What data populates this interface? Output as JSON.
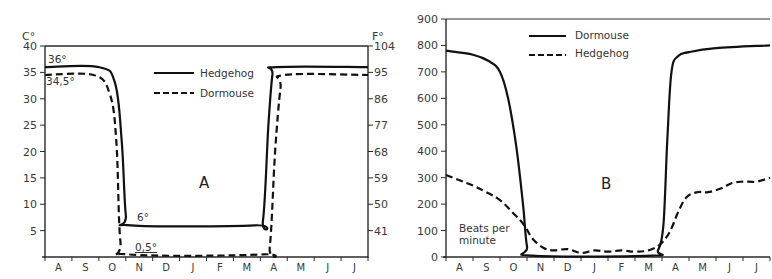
{
  "chart_data": [
    {
      "id": "A",
      "type": "line",
      "panel_label": "A",
      "title": "",
      "xlabel": "",
      "ylabel": "C°",
      "ylabel_right": "F°",
      "categories": [
        "A",
        "S",
        "O",
        "N",
        "D",
        "J",
        "F",
        "M",
        "A",
        "M",
        "J",
        "J"
      ],
      "yticks_left": [
        5,
        10,
        15,
        20,
        25,
        30,
        35,
        40
      ],
      "yticks_right": [
        41,
        50,
        59,
        68,
        77,
        86,
        95,
        104
      ],
      "ylim": [
        0,
        40
      ],
      "legend": [
        {
          "name": "Hedgehog",
          "style": "solid"
        },
        {
          "name": "Dormouse",
          "style": "dashed"
        }
      ],
      "annotations": [
        "36°",
        "34,5°",
        "6°",
        "0,5°"
      ],
      "series": [
        {
          "name": "Hedgehog",
          "style": "solid",
          "x": [
            0,
            2.0,
            2.6,
            2.85,
            3.0,
            3.2,
            7.8,
            8.1,
            8.3,
            8.45,
            8.6,
            12
          ],
          "values": [
            36,
            36,
            33,
            22,
            8,
            6,
            6,
            7,
            25,
            34.5,
            36,
            36
          ]
        },
        {
          "name": "Dormouse",
          "style": "dashed",
          "x": [
            0,
            1.8,
            2.4,
            2.65,
            2.8,
            3.1,
            8.1,
            8.35,
            8.55,
            8.75,
            8.9,
            12
          ],
          "values": [
            34.5,
            34.5,
            31,
            22,
            3,
            0.5,
            0.5,
            2,
            20,
            32,
            34.5,
            34.5
          ]
        }
      ]
    },
    {
      "id": "B",
      "type": "line",
      "panel_label": "B",
      "title": "",
      "xlabel": "",
      "ylabel": "Beats per minute",
      "categories": [
        "A",
        "S",
        "O",
        "N",
        "D",
        "J",
        "F",
        "M",
        "A",
        "M",
        "J",
        "J"
      ],
      "yticks": [
        0,
        100,
        200,
        300,
        400,
        500,
        600,
        700,
        800,
        900
      ],
      "ylim": [
        0,
        900
      ],
      "legend": [
        {
          "name": "Dormouse",
          "style": "solid"
        },
        {
          "name": "Hedgehog",
          "style": "dashed"
        }
      ],
      "annotations": [
        "Beats per minute"
      ],
      "series": [
        {
          "name": "Dormouse",
          "style": "solid",
          "x": [
            0,
            1.0,
            1.6,
            2.0,
            2.3,
            2.6,
            2.85,
            3.0,
            3.2,
            7.6,
            7.85,
            8.05,
            8.2,
            8.35,
            8.6,
            9.0,
            10.0,
            12
          ],
          "values": [
            780,
            765,
            740,
            700,
            600,
            420,
            200,
            40,
            5,
            5,
            25,
            120,
            450,
            700,
            760,
            775,
            790,
            800
          ]
        },
        {
          "name": "Hedgehog",
          "style": "dashed",
          "x": [
            0,
            0.5,
            1.0,
            1.5,
            2.0,
            2.5,
            2.9,
            3.2,
            3.6,
            4.0,
            4.5,
            5.0,
            5.5,
            6.0,
            6.5,
            7.0,
            7.5,
            7.9,
            8.2,
            8.4,
            8.6,
            8.9,
            9.3,
            9.7,
            10.2,
            10.6,
            11.0,
            11.5,
            12
          ],
          "values": [
            310,
            290,
            270,
            245,
            215,
            165,
            120,
            70,
            35,
            25,
            30,
            15,
            25,
            20,
            25,
            20,
            25,
            45,
            80,
            120,
            170,
            225,
            245,
            245,
            260,
            280,
            285,
            285,
            300
          ]
        }
      ]
    }
  ],
  "charts": {
    "A": {
      "y_unit_left": "C°",
      "y_unit_right": "F°",
      "left_ticks": [
        "5",
        "10",
        "15",
        "20",
        "25",
        "30",
        "35",
        "40"
      ],
      "right_ticks": [
        "41",
        "50",
        "59",
        "68",
        "77",
        "86",
        "95",
        "104"
      ],
      "months": [
        "A",
        "S",
        "O",
        "N",
        "D",
        "J",
        "F",
        "M",
        "A",
        "M",
        "J",
        "J"
      ],
      "legend_solid": "Hedgehog",
      "legend_dashed": "Dormouse",
      "panel_label": "A",
      "ann_36": "36°",
      "ann_345": "34,5°",
      "ann_6": "6°",
      "ann_05": "0,5°"
    },
    "B": {
      "ticks": [
        "0",
        "100",
        "200",
        "300",
        "400",
        "500",
        "600",
        "700",
        "800",
        "900"
      ],
      "months": [
        "A",
        "S",
        "O",
        "N",
        "D",
        "J",
        "F",
        "M",
        "A",
        "M",
        "J",
        "J"
      ],
      "legend_solid": "Dormouse",
      "legend_dashed": "Hedgehog",
      "panel_label": "B",
      "beats_line1": "Beats per",
      "beats_line2": "minute"
    }
  }
}
